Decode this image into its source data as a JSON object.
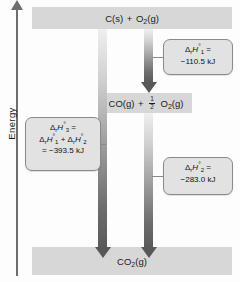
{
  "diagram": {
    "type": "enthalpy-level-diagram",
    "axis": {
      "label": "Energy",
      "direction": "up",
      "arrow_icon": "up-arrow-icon"
    },
    "levels": [
      {
        "id": "reactants",
        "position": "top",
        "formula_plain": "C(s) + O2(g)",
        "parts": [
          {
            "text": "C(s)"
          },
          {
            "text": "+"
          },
          {
            "text": "O",
            "sub": "2"
          },
          {
            "text": "(g)"
          }
        ]
      },
      {
        "id": "intermediate",
        "position": "middle",
        "formula_plain": "CO(g) + 1/2 O2(g)",
        "parts": [
          {
            "text": "CO(g)"
          },
          {
            "text": "+"
          },
          {
            "fraction": {
              "numerator": "1",
              "denominator": "2"
            }
          },
          {
            "text": "O",
            "sub": "2"
          },
          {
            "text": "(g)"
          }
        ]
      },
      {
        "id": "products",
        "position": "bottom",
        "formula_plain": "CO2(g)",
        "parts": [
          {
            "text": "CO",
            "sub": "2"
          },
          {
            "text": "(g)"
          }
        ]
      }
    ],
    "arrows": [
      {
        "id": "arrow-direct",
        "from": "reactants",
        "to": "products",
        "label_ref": "callout-3"
      },
      {
        "id": "arrow-step1",
        "from": "reactants",
        "to": "intermediate",
        "label_ref": "callout-1"
      },
      {
        "id": "arrow-step2",
        "from": "intermediate",
        "to": "products",
        "label_ref": "callout-2"
      }
    ],
    "callouts": [
      {
        "id": "callout-1",
        "symbol": "Δ",
        "sub_r": "r",
        "italic_H": "H",
        "degree": "°",
        "index": "1",
        "equals": "=",
        "value": "−110.5 kJ",
        "value_number": -110.5,
        "unit": "kJ",
        "full_text": "ΔrH°1 = −110.5 kJ"
      },
      {
        "id": "callout-2",
        "symbol": "Δ",
        "sub_r": "r",
        "italic_H": "H",
        "degree": "°",
        "index": "3",
        "equals": "=",
        "sum_line": "ΔrH°1 + ΔrH°2",
        "value": "= −393.5 kJ",
        "value_number": -393.5,
        "unit": "kJ",
        "full_text": "ΔrH°3 = ΔrH°1 + ΔrH°2 = −393.5 kJ"
      },
      {
        "id": "callout-3",
        "symbol": "Δ",
        "sub_r": "r",
        "italic_H": "H",
        "degree": "°",
        "index": "2",
        "equals": "=",
        "value": "−283.0 kJ",
        "value_number": -283.0,
        "unit": "kJ",
        "full_text": "ΔrH°2 = −283.0 kJ"
      }
    ],
    "colors": {
      "bar_fill": "#d7d7d7",
      "callout_fill": "#e2e2e2",
      "callout_border": "#8a8a8a",
      "arrow_dark": "#585858",
      "arrow_light": "#efefef",
      "axis": "#6e6e6e",
      "text": "#1a1a1a",
      "background": "#fdfdfd"
    }
  }
}
